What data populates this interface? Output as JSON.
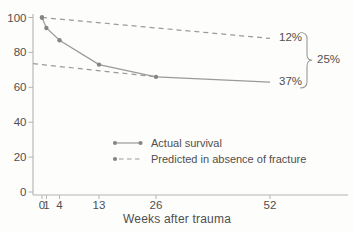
{
  "figure": {
    "xlabel": "Weeks after trauma",
    "legend": {
      "items": [
        {
          "label": "Actual survival",
          "style": "solid-with-dots"
        },
        {
          "label": "Predicted in absence of fracture",
          "style": "dashed-with-dot"
        }
      ]
    },
    "annotations": {
      "predicted_end_label": "12%",
      "actual_end_label": "37%",
      "difference_label": "25%"
    }
  },
  "chart_data": {
    "type": "line",
    "title": "",
    "xlabel": "Weeks after trauma",
    "ylabel": "",
    "xlim": [
      0,
      52
    ],
    "ylim": [
      0,
      100
    ],
    "x_ticks": [
      0,
      1,
      4,
      13,
      26,
      52
    ],
    "y_ticks": [
      0,
      20,
      40,
      60,
      80,
      100
    ],
    "grid": false,
    "legend_position": "lower-center-inside",
    "series": [
      {
        "name": "Actual survival",
        "style": "solid",
        "x": [
          0,
          1,
          4,
          13,
          26,
          52
        ],
        "y": [
          100,
          94,
          87,
          73,
          66,
          63
        ],
        "marker_x": [
          0,
          1,
          4,
          13,
          26
        ],
        "end_label": "37%"
      },
      {
        "name": "Predicted in absence of fracture",
        "style": "dashed",
        "x": [
          0,
          52
        ],
        "y": [
          100,
          88
        ],
        "marker_x": [
          0
        ],
        "end_label": "12%"
      },
      {
        "name": "Predicted (extrapolated back to time of trauma)",
        "style": "dashed",
        "x": [
          0,
          26
        ],
        "y": [
          73,
          66
        ],
        "marker_x": [],
        "extend_to_axis": true
      }
    ],
    "annotations": [
      {
        "type": "brace",
        "label": "25%",
        "at_x": 52,
        "from_value": 88,
        "to_value": 63
      }
    ],
    "colors": {
      "line": "#9a9a9a",
      "marker": "#858585",
      "axis": "#b3b3b3",
      "text": "#4f4f4f"
    }
  }
}
